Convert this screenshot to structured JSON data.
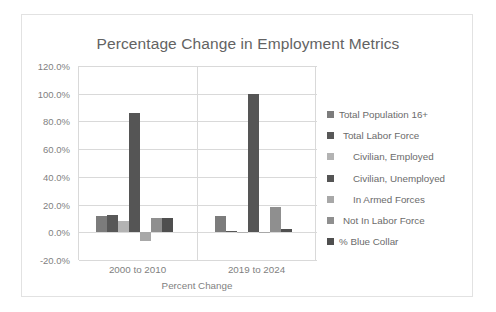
{
  "chart_data": {
    "type": "bar",
    "title": "Percentage Change in Employment Metrics",
    "xlabel": "Percent Change",
    "ylabel": "",
    "categories": [
      "2000 to 2010",
      "2019 to 2024"
    ],
    "ylim": [
      -20,
      120
    ],
    "ytick_labels": [
      "120.0%",
      "100.0%",
      "80.0%",
      "60.0%",
      "40.0%",
      "20.0%",
      "0.0%",
      "-20.0%"
    ],
    "ytick_values": [
      120,
      100,
      80,
      60,
      40,
      20,
      0,
      -20
    ],
    "grid": true,
    "legend_position": "right",
    "series": [
      {
        "name": "Total Population 16+",
        "color": "#7c7c7c",
        "values": [
          11.5,
          12.0
        ]
      },
      {
        "name": "Total Labor Force",
        "color": "#585858",
        "values": [
          12.5,
          1.0
        ]
      },
      {
        "name": "Civilian, Employed",
        "color": "#b3b3b3",
        "values": [
          8.0,
          0.5
        ]
      },
      {
        "name": "Civilian, Unemployed",
        "color": "#555555",
        "values": [
          86.0,
          99.5
        ]
      },
      {
        "name": "In Armed Forces",
        "color": "#a8a8a8",
        "values": [
          -6.0,
          0.5
        ]
      },
      {
        "name": "Not In Labor Force",
        "color": "#8f8f8f",
        "values": [
          10.0,
          18.0
        ]
      },
      {
        "name": "% Blue Collar",
        "color": "#4f4f4f",
        "values": [
          10.5,
          2.5
        ]
      }
    ]
  },
  "legend": {
    "items": [
      {
        "label": "Total Population 16+",
        "indent": 0
      },
      {
        "label": "Total Labor Force",
        "indent": 4
      },
      {
        "label": "Civilian, Employed",
        "indent": 14
      },
      {
        "label": "Civilian, Unemployed",
        "indent": 14
      },
      {
        "label": "In Armed Forces",
        "indent": 14
      },
      {
        "label": "Not In Labor Force",
        "indent": 4
      },
      {
        "label": "% Blue Collar",
        "indent": 0
      }
    ]
  }
}
